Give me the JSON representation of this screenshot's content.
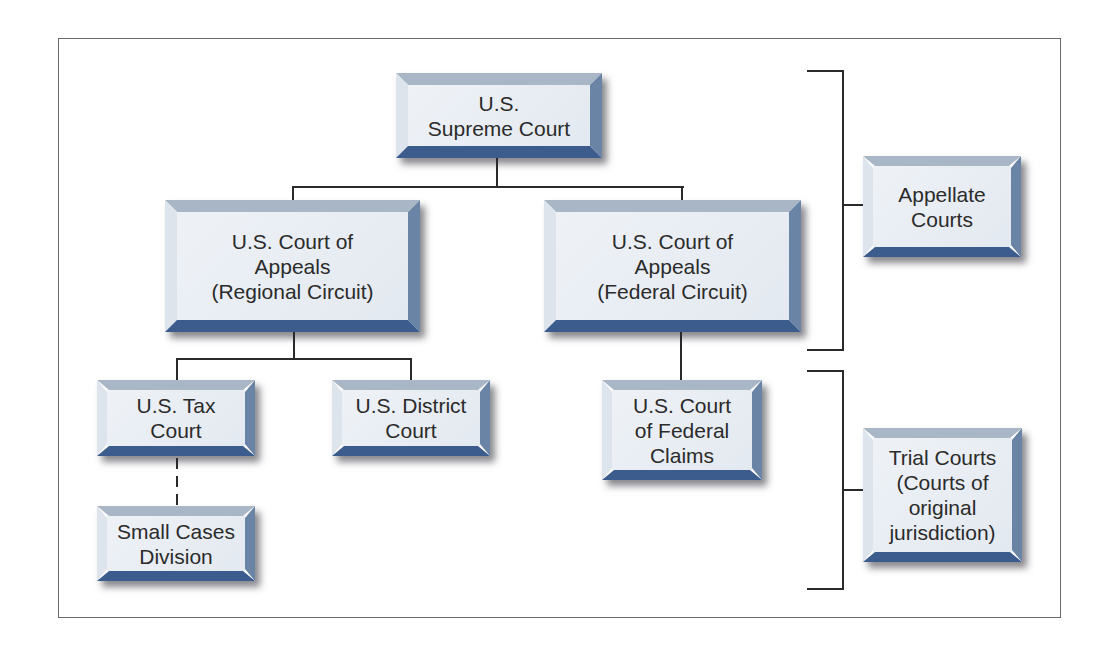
{
  "diagram": {
    "type": "hierarchy",
    "title": "",
    "nodes": {
      "supreme": {
        "label": "U.S.\nSupreme Court"
      },
      "appeals_regional": {
        "label": "U.S. Court of\nAppeals\n(Regional Circuit)"
      },
      "appeals_federal": {
        "label": "U.S. Court of\nAppeals\n(Federal Circuit)"
      },
      "tax": {
        "label": "U.S. Tax\nCourt"
      },
      "district": {
        "label": "U.S. District\nCourt"
      },
      "federal_claims": {
        "label": "U.S. Court\nof Federal\nClaims"
      },
      "small_cases": {
        "label": "Small Cases\nDivision"
      }
    },
    "categories": {
      "appellate": {
        "label": "Appellate\nCourts"
      },
      "trial": {
        "label": "Trial Courts\n(Courts of\noriginal\njurisdiction)"
      }
    },
    "edges": [
      {
        "from": "supreme",
        "to": "appeals_regional",
        "style": "solid"
      },
      {
        "from": "supreme",
        "to": "appeals_federal",
        "style": "solid"
      },
      {
        "from": "appeals_regional",
        "to": "tax",
        "style": "solid"
      },
      {
        "from": "appeals_regional",
        "to": "district",
        "style": "solid"
      },
      {
        "from": "appeals_federal",
        "to": "federal_claims",
        "style": "solid"
      },
      {
        "from": "tax",
        "to": "small_cases",
        "style": "dashed"
      }
    ],
    "groupings": [
      {
        "category": "appellate",
        "members": [
          "supreme",
          "appeals_regional",
          "appeals_federal"
        ]
      },
      {
        "category": "trial",
        "members": [
          "tax",
          "district",
          "federal_claims",
          "small_cases"
        ]
      }
    ],
    "colors": {
      "box_face": "#e8edf3",
      "bevel_top": "#a9b6c6",
      "bevel_left": "#dde4ec",
      "bevel_right": "#6a84a6",
      "bevel_bottom": "#3b5c8c",
      "line": "#2a2a2a",
      "frame": "#6a6a6a",
      "text": "#2b2b2b"
    }
  }
}
